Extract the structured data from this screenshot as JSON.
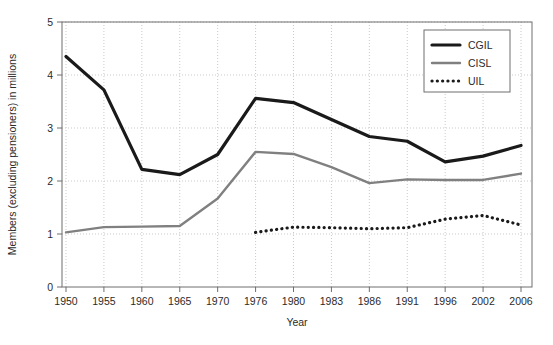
{
  "chart_data": {
    "type": "line",
    "title": "",
    "xlabel": "Year",
    "ylabel": "Members (excluding pensioners) in millions",
    "x": [
      "1950",
      "1955",
      "1960",
      "1965",
      "1970",
      "1976",
      "1980",
      "1983",
      "1986",
      "1991",
      "1996",
      "2002",
      "2006"
    ],
    "categories": [
      "1950",
      "1955",
      "1960",
      "1965",
      "1970",
      "1976",
      "1980",
      "1983",
      "1986",
      "1991",
      "1996",
      "2002",
      "2006"
    ],
    "xlim": [
      1950,
      2006
    ],
    "ylim": [
      0,
      5
    ],
    "yticks": [
      "0",
      "1",
      "2",
      "3",
      "4",
      "5"
    ],
    "grid": true,
    "legend_position": "top-right",
    "series": [
      {
        "name": "CGIL",
        "color": "#1a1a1a",
        "style": "solid-thick",
        "values": [
          4.35,
          3.72,
          2.22,
          2.12,
          2.5,
          3.56,
          3.48,
          3.16,
          2.84,
          2.75,
          2.36,
          2.47,
          2.67
        ]
      },
      {
        "name": "CISL",
        "color": "#808080",
        "style": "solid-medium",
        "values": [
          1.03,
          1.13,
          1.14,
          1.15,
          1.67,
          2.55,
          2.51,
          2.26,
          1.96,
          2.03,
          2.02,
          2.02,
          2.14
        ]
      },
      {
        "name": "UIL",
        "color": "#1a1a1a",
        "style": "dotted",
        "values": [
          null,
          null,
          null,
          null,
          null,
          1.03,
          1.13,
          1.12,
          1.1,
          1.12,
          1.28,
          1.35,
          1.17
        ]
      }
    ]
  },
  "legend": {
    "items": [
      {
        "label": "CGIL"
      },
      {
        "label": "CISL"
      },
      {
        "label": "UIL"
      }
    ]
  },
  "axes": {
    "x_title": "Year",
    "y_title": "Members (excluding pensioners) in millions"
  }
}
